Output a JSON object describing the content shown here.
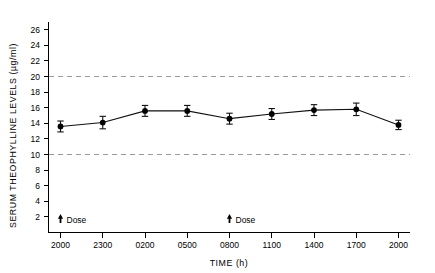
{
  "chart_data": {
    "type": "line",
    "title": "",
    "xlabel": "TIME (h)",
    "ylabel": "SERUM THEOPHYLLINE LEVELS (µg/ml)",
    "categories": [
      "2000",
      "2300",
      "0200",
      "0500",
      "0800",
      "1100",
      "1400",
      "1700",
      "2000"
    ],
    "values": [
      13.6,
      14.1,
      15.6,
      15.6,
      14.6,
      15.2,
      15.7,
      15.8,
      13.8
    ],
    "errors": [
      0.7,
      0.8,
      0.7,
      0.7,
      0.7,
      0.7,
      0.7,
      0.8,
      0.6
    ],
    "series": [
      {
        "name": "Serum theophylline",
        "values": [
          13.6,
          14.1,
          15.6,
          15.6,
          14.6,
          15.2,
          15.7,
          15.8,
          13.8
        ],
        "errors": [
          0.7,
          0.8,
          0.7,
          0.7,
          0.7,
          0.7,
          0.7,
          0.8,
          0.6
        ]
      }
    ],
    "ylim": [
      0,
      27
    ],
    "xlim": [
      0,
      8
    ],
    "yticks": [
      2,
      4,
      6,
      8,
      10,
      12,
      14,
      16,
      18,
      20,
      22,
      24,
      26
    ],
    "ytick_labels": [
      "2",
      "4",
      "6",
      "8",
      "10",
      "12",
      "14",
      "16",
      "18",
      "20",
      "22",
      "24",
      "26"
    ],
    "xtick_labels": [
      "2000",
      "2300",
      "0200",
      "0500",
      "0800",
      "1100",
      "1400",
      "1700",
      "2000"
    ],
    "grid": false,
    "legend": "none",
    "reference_lines": [
      {
        "value": 20,
        "label": "upper therapeutic limit",
        "style": "dashed",
        "color": "#9a9a9a"
      },
      {
        "value": 10,
        "label": "lower therapeutic limit",
        "style": "dashed",
        "color": "#9a9a9a"
      }
    ],
    "annotations": [
      {
        "label": "Dose",
        "x_category": "2000",
        "x_index": 0,
        "marker": "up-arrow"
      },
      {
        "label": "Dose",
        "x_category": "0800",
        "x_index": 4,
        "marker": "up-arrow"
      }
    ],
    "marker_style": "filled-circle-with-error-bars",
    "line_color": "#111111",
    "marker_color": "#000000"
  },
  "axes": {
    "x_title": "TIME (h)",
    "y_title": "SERUM THEOPHYLLINE LEVELS (µg/ml)"
  },
  "annotations": {
    "dose_left_label": "Dose",
    "dose_right_label": "Dose"
  }
}
